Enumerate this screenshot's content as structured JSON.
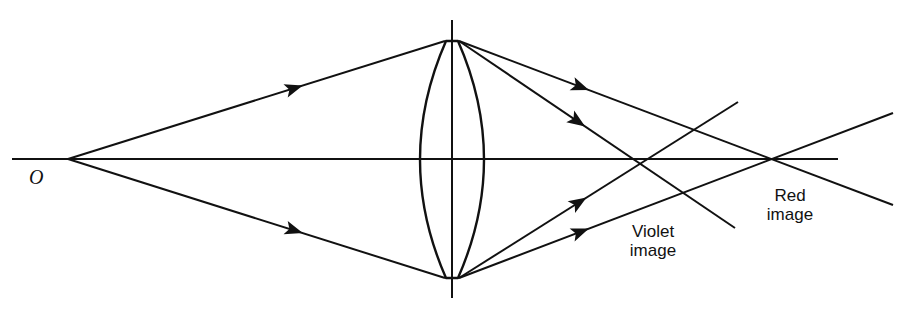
{
  "diagram": {
    "colors": {
      "ink": "#111111",
      "background": "#ffffff"
    },
    "labels": {
      "object": "O",
      "violet_line1": "Violet",
      "violet_line2": "image",
      "red_line1": "Red",
      "red_line2": "image"
    },
    "geometry": {
      "optical_axis": {
        "x1": 12,
        "y1": 159,
        "x2": 838,
        "y2": 159
      },
      "object_point": {
        "x": 68,
        "y": 159
      },
      "lens": {
        "center_x": 452,
        "top_y": 41,
        "bottom_y": 278,
        "half_width": 31,
        "axis_top": 20,
        "axis_bottom": 298
      },
      "violet_image": {
        "x": 645,
        "y": 159
      },
      "red_image": {
        "x": 770,
        "y": 159
      }
    },
    "rays": [
      {
        "name": "incident-upper",
        "from": [
          68,
          159
        ],
        "to": [
          445,
          41
        ],
        "arrow_at": 0.6
      },
      {
        "name": "incident-lower",
        "from": [
          68,
          159
        ],
        "to": [
          445,
          278
        ],
        "arrow_at": 0.6
      },
      {
        "name": "red-upper",
        "from": [
          459,
          41
        ],
        "to": [
          893,
          205
        ],
        "arrow_at": 0.28
      },
      {
        "name": "violet-upper",
        "from": [
          459,
          41
        ],
        "to": [
          735,
          228
        ],
        "arrow_at": 0.43
      },
      {
        "name": "violet-lower",
        "from": [
          459,
          278
        ],
        "to": [
          738,
          102
        ],
        "arrow_at": 0.43
      },
      {
        "name": "red-lower",
        "from": [
          459,
          278
        ],
        "to": [
          893,
          113
        ],
        "arrow_at": 0.28
      }
    ]
  }
}
